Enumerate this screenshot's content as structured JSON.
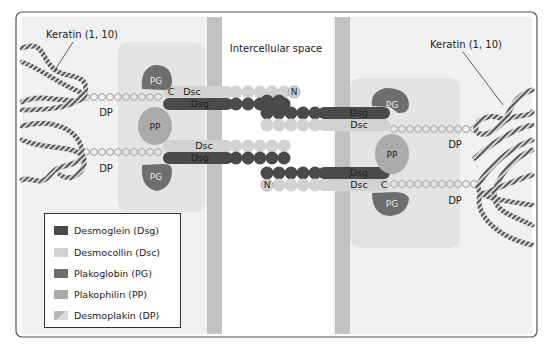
{
  "diagram": {
    "labels": {
      "intercellular_space": "Intercellular space",
      "keratin_left": "Keratin (1, 10)",
      "keratin_right": "Keratin (1, 10)",
      "dp": "DP",
      "pg": "PG",
      "pp": "PP",
      "dsc": "Dsc",
      "dsg": "Dsg",
      "c_terminus": "C",
      "n_terminus": "N"
    },
    "colors": {
      "dsg": "#4a4a4a",
      "dsc": "#cfcfcf",
      "pg": "#6e6e6e",
      "pp": "#a9a9a9",
      "dp": "#d6d6d6",
      "membrane": "#c4c4c4",
      "cytoplasm": "#efefef",
      "plaque": "#e2e2e2"
    }
  },
  "legend": {
    "items": [
      {
        "label": "Desmoglein (Dsg)",
        "color": "#4a4a4a"
      },
      {
        "label": "Desmocollin (Dsc)",
        "color": "#d2d2d2"
      },
      {
        "label": "Plakoglobin (PG)",
        "color": "#6e6e6e"
      },
      {
        "label": "Plakophilin (PP)",
        "color": "#ababab"
      },
      {
        "label": "Desmoplakin (DP)",
        "color": "#c8c8c8"
      }
    ]
  }
}
